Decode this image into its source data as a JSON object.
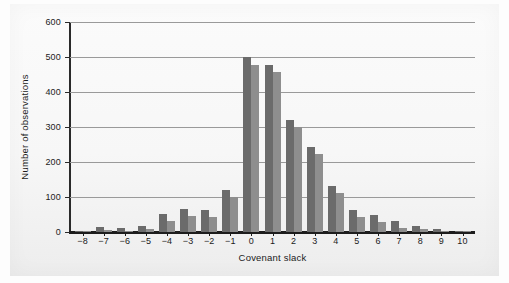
{
  "chart_data": {
    "type": "bar",
    "title": "",
    "xlabel": "Covenant slack",
    "ylabel": "Number of observations",
    "categories": [
      "−8",
      "−7",
      "−6",
      "−5",
      "−4",
      "−3",
      "−2",
      "−1",
      "0",
      "1",
      "2",
      "3",
      "4",
      "5",
      "6",
      "7",
      "8",
      "9",
      "10"
    ],
    "ylim": [
      0,
      600
    ],
    "yticks": [
      0,
      100,
      200,
      300,
      400,
      500,
      600
    ],
    "ytick_labels": [
      "0",
      "100",
      "200",
      "300",
      "400",
      "500",
      "600"
    ],
    "grid": true,
    "legend": "none",
    "series": [
      {
        "name": "series-a",
        "color": "#6b6b6b",
        "values": [
          3,
          13,
          12,
          17,
          52,
          66,
          63,
          120,
          500,
          478,
          319,
          244,
          131,
          62,
          49,
          32,
          18,
          10,
          4
        ]
      },
      {
        "name": "series-b",
        "color": "#8e8e8e",
        "values": [
          2,
          5,
          4,
          9,
          31,
          47,
          43,
          101,
          477,
          458,
          300,
          224,
          112,
          42,
          28,
          12,
          8,
          4,
          2
        ]
      }
    ]
  }
}
